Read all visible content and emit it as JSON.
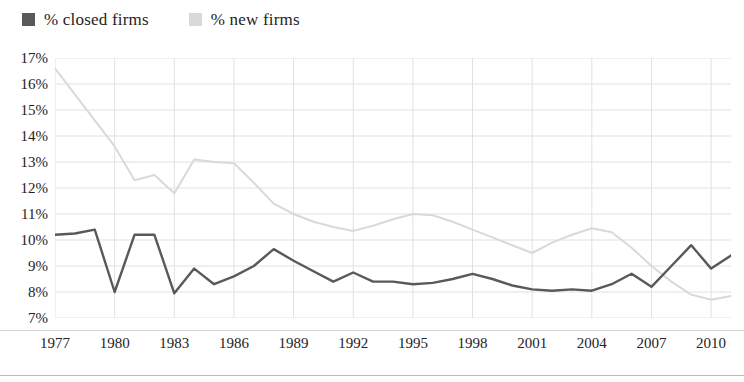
{
  "legend": {
    "items": [
      {
        "label": "% closed firms",
        "color": "#595959",
        "swatch": "legend-swatch-closed"
      },
      {
        "label": "% new firms",
        "color": "#d9d9d9",
        "swatch": "legend-swatch-new"
      }
    ]
  },
  "axes": {
    "y_ticks": [
      "17%",
      "16%",
      "15%",
      "14%",
      "13%",
      "12%",
      "11%",
      "10%",
      "9%",
      "8%",
      "7%"
    ],
    "x_ticks": [
      "1977",
      "1980",
      "1983",
      "1986",
      "1989",
      "1992",
      "1995",
      "1998",
      "2001",
      "2004",
      "2007",
      "2010"
    ]
  },
  "chart_data": {
    "type": "line",
    "title": "",
    "xlabel": "",
    "ylabel": "",
    "xlim": [
      1977,
      2011
    ],
    "ylim": [
      7,
      17
    ],
    "y_tick_values": [
      17,
      16,
      15,
      14,
      13,
      12,
      11,
      10,
      9,
      8,
      7
    ],
    "y_tick_labels": [
      "17%",
      "16%",
      "15%",
      "14%",
      "13%",
      "12%",
      "11%",
      "10%",
      "9%",
      "8%",
      "7%"
    ],
    "x_tick_values": [
      1977,
      1980,
      1983,
      1986,
      1989,
      1992,
      1995,
      1998,
      2001,
      2004,
      2007,
      2010
    ],
    "x_tick_labels": [
      "1977",
      "1980",
      "1983",
      "1986",
      "1989",
      "1992",
      "1995",
      "1998",
      "2001",
      "2004",
      "2007",
      "2010"
    ],
    "grid": true,
    "legend_position": "above-top-left",
    "x": [
      1977,
      1978,
      1979,
      1980,
      1981,
      1982,
      1983,
      1984,
      1985,
      1986,
      1987,
      1988,
      1989,
      1990,
      1991,
      1992,
      1993,
      1994,
      1995,
      1996,
      1997,
      1998,
      1999,
      2000,
      2001,
      2002,
      2003,
      2004,
      2005,
      2006,
      2007,
      2008,
      2009,
      2010,
      2011
    ],
    "series": [
      {
        "name": "% closed firms",
        "color": "#595959",
        "values": [
          10.2,
          10.25,
          10.4,
          8.0,
          10.2,
          10.2,
          7.95,
          8.9,
          8.3,
          8.6,
          9.0,
          9.65,
          9.2,
          8.8,
          8.4,
          8.75,
          8.4,
          8.4,
          8.3,
          8.35,
          8.5,
          8.7,
          8.5,
          8.25,
          8.1,
          8.05,
          8.1,
          8.05,
          8.3,
          8.7,
          8.2,
          9.0,
          9.8,
          8.9,
          9.4
        ]
      },
      {
        "name": "% new firms",
        "color": "#d9d9d9",
        "values": [
          16.6,
          15.6,
          14.6,
          13.6,
          12.3,
          12.5,
          11.8,
          13.1,
          13.0,
          12.95,
          12.2,
          11.4,
          11.0,
          10.7,
          10.5,
          10.35,
          10.55,
          10.8,
          11.0,
          10.95,
          10.7,
          10.4,
          10.1,
          9.8,
          9.5,
          9.9,
          10.2,
          10.45,
          10.3,
          9.7,
          9.0,
          8.4,
          7.9,
          7.7,
          7.85
        ]
      }
    ]
  }
}
